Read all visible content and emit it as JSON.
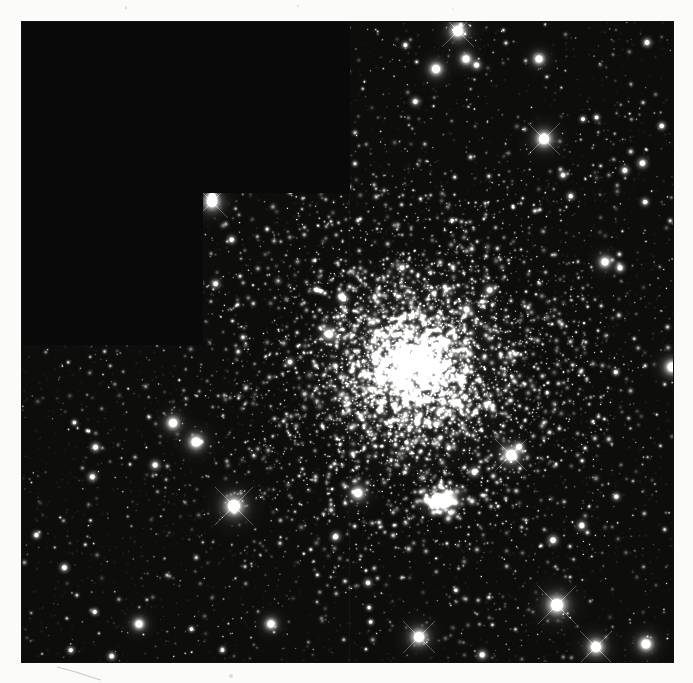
{
  "page": {
    "width": 693,
    "height": 683,
    "background": "#fbfbf9"
  },
  "photo": {
    "alt": "Black-and-white telescope mosaic photograph of a dense star cluster; upper-left staircase region unexposed (black); bright compact knot of stars below the cluster core",
    "x": 22,
    "y": 22,
    "width": 651,
    "height": 640,
    "sky_background": "#0d0d0c",
    "masked_background": "#090909",
    "seed": 20251,
    "masked_regions": [
      {
        "x": 0,
        "y": 0,
        "width": 181,
        "height": 323
      },
      {
        "x": 181,
        "y": 0,
        "width": 147,
        "height": 171
      }
    ],
    "seam": {
      "x": 327,
      "y1": 171,
      "y2": 640,
      "alpha": 0.035
    },
    "noise": {
      "count": 2600,
      "r_min": 0.4,
      "r_max": 0.9,
      "b_min": 0.03,
      "b_max": 0.12
    },
    "field_stars": {
      "count": 1500,
      "r_min": 0.5,
      "r_max": 1.6,
      "b_min": 0.2,
      "b_max": 0.95
    },
    "medium_stars": {
      "count": 55,
      "r_min": 1.8,
      "r_max": 3.2,
      "b_min": 0.75,
      "b_max": 1.0
    },
    "cluster": {
      "cx": 393,
      "cy": 346,
      "layers": [
        {
          "sigma": 165,
          "count": 1500,
          "r_min": 0.5,
          "r_max": 1.7,
          "b_min": 0.25,
          "b_max": 0.95
        },
        {
          "sigma": 92,
          "count": 2100,
          "r_min": 0.5,
          "r_max": 1.9,
          "b_min": 0.3,
          "b_max": 1.0
        },
        {
          "sigma": 45,
          "count": 1600,
          "r_min": 0.6,
          "r_max": 2.2,
          "b_min": 0.35,
          "b_max": 1.0
        },
        {
          "sigma": 20,
          "count": 520,
          "r_min": 0.7,
          "r_max": 2.4,
          "b_min": 0.4,
          "b_max": 1.0
        }
      ],
      "glows": [
        {
          "r": 120,
          "alpha": 0.1
        },
        {
          "r": 62,
          "alpha": 0.16
        },
        {
          "r": 30,
          "alpha": 0.18
        }
      ]
    },
    "knot": {
      "cx": 420,
      "cy": 478,
      "rx": 17,
      "ry": 9,
      "angle_deg": -14,
      "glow_r": 30,
      "glow_alpha": 0.3,
      "stars": {
        "sigma": 10,
        "count": 48,
        "r_min": 0.8,
        "r_max": 2.4,
        "b_min": 0.5,
        "b_max": 1.0
      }
    },
    "bright_stars": [
      {
        "x": 190,
        "y": 180,
        "r": 5.0,
        "spikes": true
      },
      {
        "x": 414,
        "y": 47,
        "r": 4.0,
        "spikes": false
      },
      {
        "x": 436,
        "y": 9,
        "r": 5.0,
        "spikes": true
      },
      {
        "x": 522,
        "y": 117,
        "r": 5.0,
        "spikes": true
      },
      {
        "x": 444,
        "y": 37,
        "r": 3.5,
        "spikes": false
      },
      {
        "x": 517,
        "y": 37,
        "r": 3.5,
        "spikes": false
      },
      {
        "x": 151,
        "y": 401,
        "r": 4.0,
        "spikes": false
      },
      {
        "x": 174,
        "y": 420,
        "r": 4.5,
        "spikes": false
      },
      {
        "x": 212,
        "y": 484,
        "r": 6.0,
        "spikes": true
      },
      {
        "x": 489,
        "y": 433,
        "r": 5.0,
        "spikes": true
      },
      {
        "x": 535,
        "y": 583,
        "r": 6.0,
        "spikes": true
      },
      {
        "x": 574,
        "y": 625,
        "r": 5.0,
        "spikes": true
      },
      {
        "x": 624,
        "y": 622,
        "r": 4.5,
        "spikes": false
      },
      {
        "x": 397,
        "y": 615,
        "r": 5.0,
        "spikes": true
      },
      {
        "x": 650,
        "y": 345,
        "r": 4.5,
        "spikes": false
      },
      {
        "x": 583,
        "y": 240,
        "r": 3.5,
        "spikes": false
      },
      {
        "x": 117,
        "y": 602,
        "r": 3.5,
        "spikes": false
      },
      {
        "x": 249,
        "y": 602,
        "r": 3.5,
        "spikes": false
      },
      {
        "x": 307,
        "y": 312,
        "r": 3.5,
        "spikes": false
      },
      {
        "x": 336,
        "y": 471,
        "r": 4.0,
        "spikes": false
      }
    ]
  },
  "margin_artifacts": {
    "specks": [
      {
        "x": 126,
        "y": 8,
        "r": 1.4,
        "color": "#e3e3de"
      },
      {
        "x": 298,
        "y": 6,
        "r": 1.2,
        "color": "#e6e6e1"
      },
      {
        "x": 453,
        "y": 9,
        "r": 1.0,
        "color": "#eaeae5"
      },
      {
        "x": 231,
        "y": 676,
        "r": 2.0,
        "color": "#dcdcd6"
      }
    ],
    "scratch": {
      "points": [
        [
          57,
          667
        ],
        [
          76,
          672
        ],
        [
          91,
          677
        ],
        [
          101,
          680
        ]
      ],
      "color": "#c9c9c2",
      "width": 1.2
    }
  }
}
